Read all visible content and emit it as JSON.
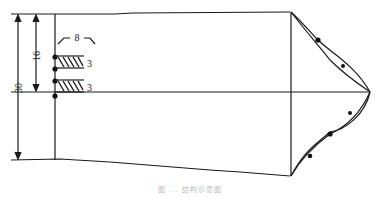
{
  "diagram": {
    "dimensions": {
      "total_height": "30",
      "upper_height": "16",
      "gap_width": "8",
      "layer_1_thickness": "3",
      "layer_2_thickness": "3"
    },
    "caption": "图 ... 结构示意图",
    "colors": {
      "line": "#1a1a1a",
      "background": "#ffffff"
    }
  }
}
